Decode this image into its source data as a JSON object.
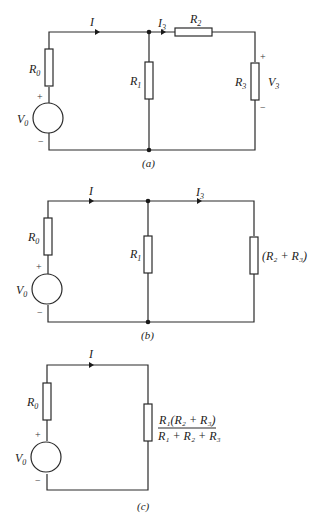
{
  "figure": {
    "panels": [
      {
        "caption": "(a)",
        "labels": {
          "current_total": "I",
          "current_branch": "I",
          "current_branch_sub": "3",
          "r0": "R",
          "r0_sub": "0",
          "r1": "R",
          "r1_sub": "1",
          "r2": "R",
          "r2_sub": "2",
          "r3": "R",
          "r3_sub": "3",
          "v3": "V",
          "v3_sub": "3",
          "v0": "V",
          "v0_sub": "0",
          "plus": "+",
          "minus": "−"
        }
      },
      {
        "caption": "(b)",
        "labels": {
          "current_total": "I",
          "current_branch": "I",
          "current_branch_sub": "3",
          "r0": "R",
          "r0_sub": "0",
          "r1": "R",
          "r1_sub": "1",
          "r23": "(R₂ + R₃)",
          "v0": "V",
          "v0_sub": "0",
          "plus": "+",
          "minus": "−"
        }
      },
      {
        "caption": "(c)",
        "labels": {
          "current_total": "I",
          "r0": "R",
          "r0_sub": "0",
          "req_numerator": "R₁(R₂ + R₃)",
          "req_denominator": "R₁ + R₂ + R₃",
          "v0": "V",
          "v0_sub": "0",
          "plus": "+",
          "minus": "−"
        }
      }
    ]
  }
}
